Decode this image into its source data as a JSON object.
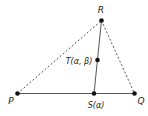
{
  "diagram": {
    "type": "geometry-triangle",
    "colors": {
      "background": "#ffffff",
      "line": "#555555",
      "point": "#111111",
      "text": "#222222"
    },
    "points": [
      {
        "id": "R",
        "label": "R",
        "x": 101.5,
        "y": 20.5,
        "label_x": 101,
        "label_y": 13
      },
      {
        "id": "P",
        "label": "P",
        "x": 17.5,
        "y": 93.5,
        "label_x": 11,
        "label_y": 104
      },
      {
        "id": "S",
        "label": "S(α)",
        "x": 94,
        "y": 93.5,
        "label_x": 96,
        "label_y": 108
      },
      {
        "id": "Q",
        "label": "Q",
        "x": 134.5,
        "y": 93.5,
        "label_x": 141,
        "label_y": 104
      },
      {
        "id": "T",
        "label": "T(α, β)",
        "x": 97.5,
        "y": 60,
        "label_x": 79,
        "label_y": 64
      }
    ],
    "segments": [
      {
        "from": "P",
        "to": "Q",
        "style": "solid"
      },
      {
        "from": "R",
        "to": "S",
        "style": "solid"
      },
      {
        "from": "P",
        "to": "R",
        "style": "dashed"
      },
      {
        "from": "R",
        "to": "Q",
        "style": "dashed"
      }
    ]
  }
}
